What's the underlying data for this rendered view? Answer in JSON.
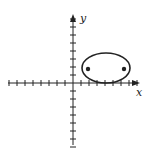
{
  "diagram": {
    "type": "coordinate-plane-ellipse",
    "axes": {
      "x_label": "x",
      "y_label": "y",
      "tick_spacing_units": 1,
      "x_ticks_negative": 8,
      "x_ticks_positive": 8,
      "y_ticks_positive": 8,
      "y_ticks_negative": 8
    },
    "ellipse": {
      "center": [
        4,
        2
      ],
      "semi_major_axis": 3,
      "semi_minor_axis": 2,
      "foci": [
        [
          1.8,
          2
        ],
        [
          6.2,
          2
        ]
      ],
      "tangent_to_x_axis": true
    },
    "colors": {
      "stroke": "#222222",
      "background": "#ffffff"
    }
  }
}
